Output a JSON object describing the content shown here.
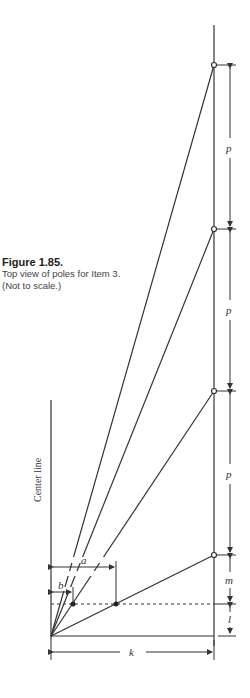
{
  "caption": {
    "title": "Figure 1.85.",
    "body": "Top view of poles for Item 3. (Not to scale.)"
  },
  "labels": {
    "center_line": "Center line",
    "p": "p",
    "m": "m",
    "l": "l",
    "k": "k",
    "a": "a",
    "b": "b"
  },
  "colors": {
    "ink": "#333333"
  }
}
